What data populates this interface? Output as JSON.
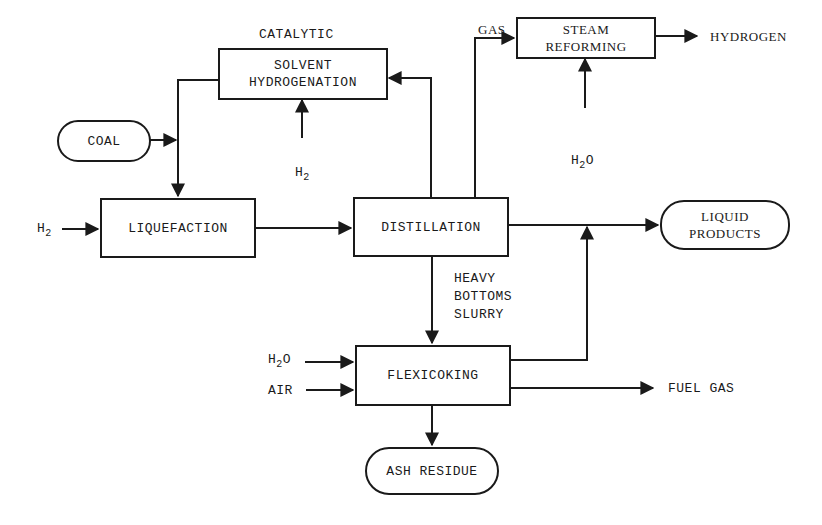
{
  "diagram": {
    "type": "process-flow",
    "nodes": {
      "solvent_hydrogenation": {
        "line1": "SOLVENT",
        "line2": "HYDROGENATION",
        "caption": "CATALYTIC"
      },
      "steam_reforming": {
        "line1": "STEAM",
        "line2": "REFORMING"
      },
      "coal": {
        "label": "COAL"
      },
      "liquefaction": {
        "label": "LIQUEFACTION"
      },
      "distillation": {
        "label": "DISTILLATION"
      },
      "liquid_products": {
        "line1": "LIQUID",
        "line2": "PRODUCTS"
      },
      "flexicoking": {
        "label": "FLEXICOKING"
      },
      "ash_residue": {
        "label": "ASH RESIDUE"
      }
    },
    "stream_labels": {
      "gas": "GAS",
      "hydrogen": "HYDROGEN",
      "h2_base": "H",
      "h2_sub": "2",
      "h2o_base": "H",
      "h2o_sub": "2",
      "h2o_tail": "O",
      "heavy_line1": "HEAVY",
      "heavy_line2": "BOTTOMS",
      "heavy_line3": "SLURRY",
      "air": "AIR",
      "fuel_gas": "FUEL GAS"
    },
    "edges": [
      {
        "from": "coal",
        "to": "liquefaction"
      },
      {
        "from": "solvent_hydrogenation",
        "to": "liquefaction"
      },
      {
        "from": "H2",
        "to": "liquefaction"
      },
      {
        "from": "H2",
        "to": "solvent_hydrogenation"
      },
      {
        "from": "liquefaction",
        "to": "distillation"
      },
      {
        "from": "distillation",
        "to": "solvent_hydrogenation"
      },
      {
        "from": "distillation",
        "to": "steam_reforming",
        "label": "GAS"
      },
      {
        "from": "H2O",
        "to": "steam_reforming"
      },
      {
        "from": "steam_reforming",
        "to": "HYDROGEN"
      },
      {
        "from": "distillation",
        "to": "liquid_products"
      },
      {
        "from": "distillation",
        "to": "flexicoking",
        "label": "HEAVY BOTTOMS SLURRY"
      },
      {
        "from": "H2O",
        "to": "flexicoking"
      },
      {
        "from": "AIR",
        "to": "flexicoking"
      },
      {
        "from": "flexicoking",
        "to": "liquid_products"
      },
      {
        "from": "flexicoking",
        "to": "FUEL GAS"
      },
      {
        "from": "flexicoking",
        "to": "ash_residue"
      }
    ],
    "colors": {
      "ink": "#1a1a1a",
      "background": "#ffffff"
    }
  }
}
